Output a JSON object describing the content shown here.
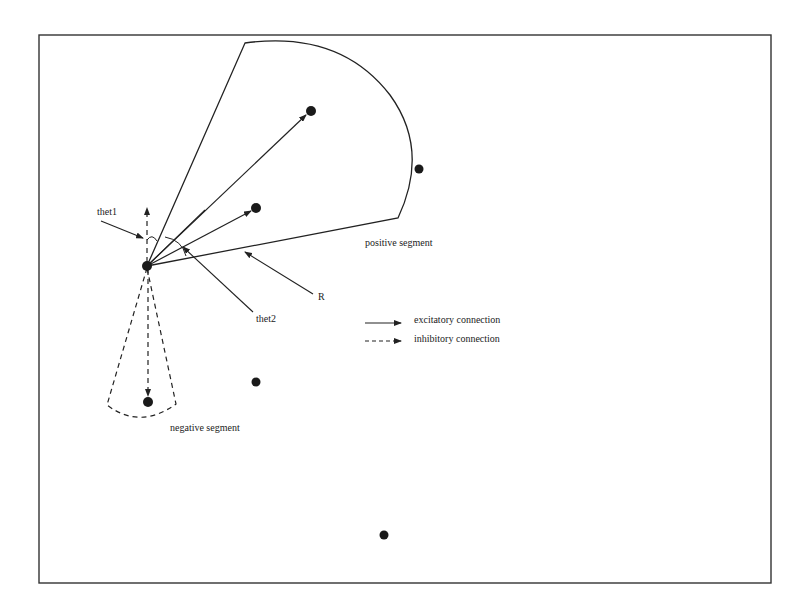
{
  "diagram": {
    "type": "neuron-connection-segments",
    "colors": {
      "ink": "#222222",
      "background": "#ffffff",
      "frame": "#333333"
    },
    "labels": {
      "thet1": "thet1",
      "thet2": "thet2",
      "radius": "R",
      "positive_segment": "positive segment",
      "negative_segment": "negative segment"
    },
    "legend": {
      "items": [
        {
          "style": "solid",
          "label": "excitatory connection"
        },
        {
          "style": "dashed",
          "label": "inhibitory connection"
        }
      ]
    },
    "nodes": [
      {
        "id": "source",
        "x": 147,
        "y": 266
      },
      {
        "id": "pos-target-far",
        "x": 311,
        "y": 111
      },
      {
        "id": "pos-target-near",
        "x": 256,
        "y": 208
      },
      {
        "id": "outside-right",
        "x": 419,
        "y": 169
      },
      {
        "id": "neg-target",
        "x": 148,
        "y": 402
      },
      {
        "id": "outside-middle",
        "x": 256,
        "y": 382
      },
      {
        "id": "outside-bottom",
        "x": 384,
        "y": 535
      }
    ]
  }
}
